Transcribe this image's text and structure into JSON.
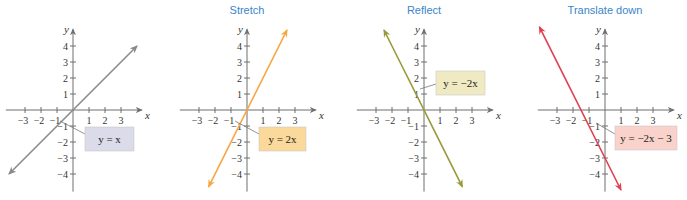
{
  "chart_data": [
    {
      "type": "line",
      "title": "",
      "xlabel": "x",
      "ylabel": "y",
      "xlim": [
        -4,
        4
      ],
      "ylim": [
        -5,
        5
      ],
      "x_ticks": [
        -3,
        -2,
        -1,
        1,
        2,
        3
      ],
      "y_ticks": [
        -4,
        -3,
        -2,
        -1,
        1,
        2,
        3,
        4
      ],
      "grid": false,
      "series": [
        {
          "name": "y = x",
          "equation": "y = x",
          "slope": 1,
          "intercept": 0,
          "color": "#8a8a8a",
          "points": [
            [
              -4,
              -4
            ],
            [
              4,
              4
            ]
          ]
        }
      ],
      "annotation": {
        "text": "y = x",
        "box_color": "#dcdbe9"
      }
    },
    {
      "type": "line",
      "title": "Stretch",
      "xlabel": "x",
      "ylabel": "y",
      "xlim": [
        -4,
        4
      ],
      "ylim": [
        -5,
        5
      ],
      "x_ticks": [
        -3,
        -2,
        -1,
        1,
        2,
        3
      ],
      "y_ticks": [
        -4,
        -3,
        -2,
        -1,
        1,
        2,
        3,
        4
      ],
      "grid": false,
      "series": [
        {
          "name": "y = 2x",
          "equation": "y = 2x",
          "slope": 2,
          "intercept": 0,
          "color": "#f5a742",
          "points": [
            [
              -2.4,
              -4.8
            ],
            [
              2.5,
              5.0
            ]
          ]
        }
      ],
      "annotation": {
        "text": "y = 2x",
        "box_color": "#fbd99a"
      }
    },
    {
      "type": "line",
      "title": "Reflect",
      "xlabel": "x",
      "ylabel": "y",
      "xlim": [
        -4,
        4
      ],
      "ylim": [
        -5,
        5
      ],
      "x_ticks": [
        -3,
        -2,
        -1,
        1,
        2,
        3
      ],
      "y_ticks": [
        -4,
        -3,
        -2,
        -1,
        1,
        2,
        3,
        4
      ],
      "grid": false,
      "series": [
        {
          "name": "y = -2x",
          "equation": "y = −2x",
          "slope": -2,
          "intercept": 0,
          "color": "#9a9a3a",
          "points": [
            [
              -2.5,
              5.0
            ],
            [
              2.4,
              -4.8
            ]
          ]
        }
      ],
      "annotation": {
        "text": "y = −2x",
        "box_color": "#efeac2"
      }
    },
    {
      "type": "line",
      "title": "Translate down",
      "xlabel": "x",
      "ylabel": "y",
      "xlim": [
        -4,
        4
      ],
      "ylim": [
        -5,
        5
      ],
      "x_ticks": [
        -3,
        -2,
        -1,
        1,
        2,
        3
      ],
      "y_ticks": [
        -4,
        -3,
        -2,
        -1,
        1,
        2,
        3,
        4
      ],
      "grid": false,
      "series": [
        {
          "name": "y = -2x - 3",
          "equation": "y = −2x − 3",
          "slope": -2,
          "intercept": -3,
          "color": "#e0404f",
          "points": [
            [
              -4.1,
              5.2
            ],
            [
              1.0,
              -5.0
            ]
          ]
        }
      ],
      "annotation": {
        "text": "y = −2x − 3",
        "box_color": "#f9d2cc"
      }
    }
  ],
  "panels": [
    {
      "title": "",
      "equation": "y = x",
      "axis_x": "x",
      "axis_y": "y"
    },
    {
      "title": "Stretch",
      "equation": "y = 2x",
      "axis_x": "x",
      "axis_y": "y"
    },
    {
      "title": "Reflect",
      "equation": "y = −2x",
      "axis_x": "x",
      "axis_y": "y"
    },
    {
      "title": "Translate down",
      "equation": "y = −2x − 3",
      "axis_x": "x",
      "axis_y": "y"
    }
  ],
  "tick_labels": {
    "x": [
      "−3",
      "−2",
      "−1",
      "1",
      "2",
      "3"
    ],
    "y": [
      "4",
      "3",
      "2",
      "1",
      "−1",
      "−2",
      "−3",
      "−4"
    ]
  }
}
